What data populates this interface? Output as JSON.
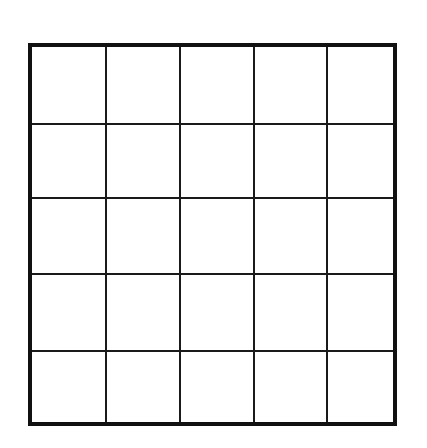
{
  "diagram": {
    "type": "grid",
    "rows": 5,
    "columns": 5,
    "cells_filled": false,
    "border_color": "#111111",
    "line_color": "#1a1a1a",
    "background": "#ffffff",
    "column_lines_px": [
      73,
      147,
      221,
      294
    ],
    "row_lines_px": [
      76,
      150,
      226,
      303
    ]
  }
}
